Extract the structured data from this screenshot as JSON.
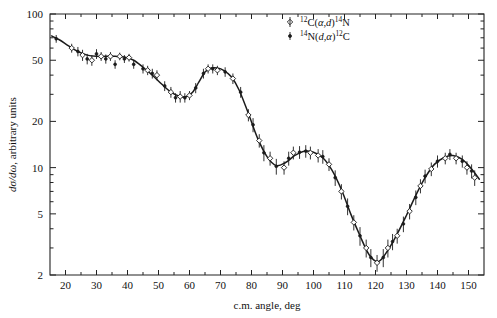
{
  "figure": {
    "background": "#ffffff",
    "ink_color": "#1b1b1b"
  },
  "axes": {
    "x": {
      "label": "c.m. angle, deg",
      "scale": "linear",
      "min": 15,
      "max": 155,
      "ticks": [
        20,
        30,
        40,
        50,
        60,
        70,
        80,
        90,
        100,
        110,
        120,
        130,
        140,
        150
      ],
      "tick_labels": [
        "20",
        "30",
        "40",
        "50",
        "60",
        "70",
        "80",
        "90",
        "100",
        "110",
        "120",
        "130",
        "140",
        "150"
      ]
    },
    "y": {
      "label_plain": "dσ/dω, arbitrary units",
      "label_num": "dσ",
      "label_den": "dω",
      "label_rest": ", arbitrary units",
      "scale": "log",
      "min": 2,
      "max": 100,
      "ticks": [
        100,
        50,
        20,
        10,
        5,
        2
      ],
      "tick_labels": [
        "100",
        "50",
        "20",
        "10",
        "5",
        "2"
      ],
      "minor_ticks": [
        90,
        80,
        70,
        60,
        40,
        30,
        9,
        8,
        7,
        6,
        4,
        3
      ]
    }
  },
  "legend": {
    "position": "top-right",
    "entries": [
      {
        "marker": "open-diamond",
        "pre_sup": "12",
        "element1": "C(",
        "greek1": "α",
        "comma": ",",
        "ital1": "d",
        "close": ")",
        "post_sup": "14",
        "element2": "N",
        "text": "12C(α,d)14N"
      },
      {
        "marker": "filled-point",
        "pre_sup": "14",
        "element1": "N(",
        "ital1": "d",
        "comma": ",",
        "greek1": "α",
        "close": ")",
        "post_sup": "12",
        "element2": "C",
        "text": "14N(d,α)12C"
      }
    ]
  },
  "chart_data": {
    "type": "scatter",
    "title": "",
    "xlabel": "c.m. angle, deg",
    "ylabel": "dσ/dω, arbitrary units",
    "xlim": [
      15,
      155
    ],
    "ylim": [
      2,
      100
    ],
    "yscale": "log",
    "xscale": "linear",
    "grid": false,
    "legend_position": "top-right",
    "series": [
      {
        "name": "12C(α,d)14N",
        "marker": "open-diamond",
        "points": [
          {
            "x": 22.0,
            "y": 60.0,
            "err": 4.0
          },
          {
            "x": 25.5,
            "y": 54.0,
            "err": 4.5
          },
          {
            "x": 28.5,
            "y": 50.0,
            "err": 4.0
          },
          {
            "x": 31.5,
            "y": 53.0,
            "err": 3.5
          },
          {
            "x": 34.5,
            "y": 53.0,
            "err": 3.5
          },
          {
            "x": 37.5,
            "y": 53.0,
            "err": 3.0
          },
          {
            "x": 40.5,
            "y": 52.0,
            "err": 3.0
          },
          {
            "x": 46.5,
            "y": 43.0,
            "err": 3.0
          },
          {
            "x": 49.5,
            "y": 40.0,
            "err": 3.0
          },
          {
            "x": 54.0,
            "y": 31.0,
            "err": 2.5
          },
          {
            "x": 57.0,
            "y": 29.0,
            "err": 2.5
          },
          {
            "x": 60.0,
            "y": 29.5,
            "err": 2.0
          },
          {
            "x": 66.0,
            "y": 44.0,
            "err": 3.0
          },
          {
            "x": 69.0,
            "y": 43.0,
            "err": 3.0
          },
          {
            "x": 74.0,
            "y": 38.0,
            "err": 3.0
          },
          {
            "x": 79.0,
            "y": 22.0,
            "err": 2.0
          },
          {
            "x": 82.5,
            "y": 15.0,
            "err": 1.5
          },
          {
            "x": 86.0,
            "y": 11.5,
            "err": 1.2
          },
          {
            "x": 90.5,
            "y": 10.0,
            "err": 1.0
          },
          {
            "x": 93.5,
            "y": 12.5,
            "err": 1.2
          },
          {
            "x": 99.0,
            "y": 12.5,
            "err": 1.2
          },
          {
            "x": 101.5,
            "y": 12.0,
            "err": 1.2
          },
          {
            "x": 105.0,
            "y": 10.5,
            "err": 1.0
          },
          {
            "x": 109.0,
            "y": 7.0,
            "err": 0.8
          },
          {
            "x": 113.0,
            "y": 4.4,
            "err": 0.5
          },
          {
            "x": 117.0,
            "y": 3.0,
            "err": 0.4
          },
          {
            "x": 120.5,
            "y": 2.4,
            "err": 0.3
          },
          {
            "x": 124.0,
            "y": 3.0,
            "err": 0.4
          },
          {
            "x": 127.0,
            "y": 3.6,
            "err": 0.4
          },
          {
            "x": 131.0,
            "y": 5.2,
            "err": 0.6
          },
          {
            "x": 134.5,
            "y": 7.6,
            "err": 0.8
          },
          {
            "x": 138.0,
            "y": 9.8,
            "err": 1.0
          },
          {
            "x": 142.5,
            "y": 11.5,
            "err": 1.0
          },
          {
            "x": 146.0,
            "y": 11.5,
            "err": 1.0
          },
          {
            "x": 149.5,
            "y": 10.0,
            "err": 1.0
          },
          {
            "x": 152.0,
            "y": 8.6,
            "err": 1.0
          }
        ]
      },
      {
        "name": "14N(d,α)12C",
        "marker": "filled-point",
        "points": [
          {
            "x": 17.0,
            "y": 69.0,
            "err": 4.0
          },
          {
            "x": 24.0,
            "y": 57.0,
            "err": 4.0
          },
          {
            "x": 27.0,
            "y": 51.0,
            "err": 4.0
          },
          {
            "x": 30.0,
            "y": 55.0,
            "err": 4.0
          },
          {
            "x": 33.0,
            "y": 51.0,
            "err": 3.5
          },
          {
            "x": 36.0,
            "y": 47.0,
            "err": 3.0
          },
          {
            "x": 39.0,
            "y": 51.0,
            "err": 3.0
          },
          {
            "x": 42.0,
            "y": 47.0,
            "err": 3.0
          },
          {
            "x": 45.0,
            "y": 44.0,
            "err": 3.0
          },
          {
            "x": 48.0,
            "y": 41.0,
            "err": 3.0
          },
          {
            "x": 52.0,
            "y": 34.0,
            "err": 2.5
          },
          {
            "x": 55.5,
            "y": 28.5,
            "err": 2.0
          },
          {
            "x": 58.5,
            "y": 28.5,
            "err": 2.0
          },
          {
            "x": 62.0,
            "y": 33.0,
            "err": 2.5
          },
          {
            "x": 64.5,
            "y": 41.0,
            "err": 3.0
          },
          {
            "x": 67.5,
            "y": 44.0,
            "err": 3.0
          },
          {
            "x": 71.5,
            "y": 42.0,
            "err": 3.0
          },
          {
            "x": 76.5,
            "y": 31.0,
            "err": 2.5
          },
          {
            "x": 80.5,
            "y": 19.0,
            "err": 2.0
          },
          {
            "x": 84.0,
            "y": 12.5,
            "err": 1.5
          },
          {
            "x": 88.0,
            "y": 10.2,
            "err": 1.2
          },
          {
            "x": 92.0,
            "y": 11.5,
            "err": 1.2
          },
          {
            "x": 95.5,
            "y": 12.6,
            "err": 1.2
          },
          {
            "x": 97.5,
            "y": 12.8,
            "err": 1.2
          },
          {
            "x": 103.0,
            "y": 11.8,
            "err": 1.2
          },
          {
            "x": 107.0,
            "y": 8.6,
            "err": 1.0
          },
          {
            "x": 111.0,
            "y": 5.6,
            "err": 0.7
          },
          {
            "x": 115.0,
            "y": 3.6,
            "err": 0.5
          },
          {
            "x": 118.5,
            "y": 2.6,
            "err": 0.35
          },
          {
            "x": 122.5,
            "y": 2.6,
            "err": 0.35
          },
          {
            "x": 125.5,
            "y": 3.3,
            "err": 0.4
          },
          {
            "x": 129.0,
            "y": 4.3,
            "err": 0.5
          },
          {
            "x": 133.0,
            "y": 6.4,
            "err": 0.7
          },
          {
            "x": 136.0,
            "y": 8.8,
            "err": 0.9
          },
          {
            "x": 140.0,
            "y": 11.0,
            "err": 1.0
          },
          {
            "x": 144.0,
            "y": 12.2,
            "err": 1.0
          },
          {
            "x": 148.0,
            "y": 11.0,
            "err": 1.0
          },
          {
            "x": 151.0,
            "y": 9.5,
            "err": 1.0
          }
        ]
      }
    ],
    "fit_curve": {
      "name": "smooth fit",
      "points": [
        {
          "x": 15.5,
          "y": 72.0
        },
        {
          "x": 18.0,
          "y": 68.0
        },
        {
          "x": 21.0,
          "y": 62.0
        },
        {
          "x": 24.0,
          "y": 57.0
        },
        {
          "x": 27.0,
          "y": 54.0
        },
        {
          "x": 30.0,
          "y": 53.0
        },
        {
          "x": 33.0,
          "y": 53.0
        },
        {
          "x": 36.0,
          "y": 53.0
        },
        {
          "x": 39.0,
          "y": 52.5
        },
        {
          "x": 42.0,
          "y": 50.0
        },
        {
          "x": 45.0,
          "y": 45.0
        },
        {
          "x": 48.0,
          "y": 40.0
        },
        {
          "x": 51.0,
          "y": 35.0
        },
        {
          "x": 54.0,
          "y": 31.0
        },
        {
          "x": 57.0,
          "y": 29.0
        },
        {
          "x": 59.0,
          "y": 29.0
        },
        {
          "x": 61.0,
          "y": 31.0
        },
        {
          "x": 63.0,
          "y": 36.0
        },
        {
          "x": 65.0,
          "y": 42.0
        },
        {
          "x": 67.0,
          "y": 44.5
        },
        {
          "x": 69.0,
          "y": 44.5
        },
        {
          "x": 71.0,
          "y": 43.0
        },
        {
          "x": 73.5,
          "y": 39.0
        },
        {
          "x": 76.0,
          "y": 32.0
        },
        {
          "x": 79.0,
          "y": 22.5
        },
        {
          "x": 82.0,
          "y": 15.5
        },
        {
          "x": 85.0,
          "y": 11.8
        },
        {
          "x": 88.0,
          "y": 10.3
        },
        {
          "x": 91.0,
          "y": 10.8
        },
        {
          "x": 94.0,
          "y": 12.0
        },
        {
          "x": 97.0,
          "y": 12.8
        },
        {
          "x": 100.0,
          "y": 12.6
        },
        {
          "x": 103.0,
          "y": 11.6
        },
        {
          "x": 106.0,
          "y": 9.6
        },
        {
          "x": 109.0,
          "y": 7.2
        },
        {
          "x": 112.0,
          "y": 5.0
        },
        {
          "x": 115.0,
          "y": 3.6
        },
        {
          "x": 118.0,
          "y": 2.7
        },
        {
          "x": 121.0,
          "y": 2.45
        },
        {
          "x": 124.0,
          "y": 2.9
        },
        {
          "x": 127.0,
          "y": 3.7
        },
        {
          "x": 130.0,
          "y": 4.9
        },
        {
          "x": 133.0,
          "y": 6.6
        },
        {
          "x": 136.0,
          "y": 8.6
        },
        {
          "x": 139.0,
          "y": 10.5
        },
        {
          "x": 142.0,
          "y": 11.6
        },
        {
          "x": 145.0,
          "y": 12.0
        },
        {
          "x": 148.0,
          "y": 11.3
        },
        {
          "x": 151.0,
          "y": 9.8
        },
        {
          "x": 153.5,
          "y": 8.4
        }
      ]
    }
  }
}
